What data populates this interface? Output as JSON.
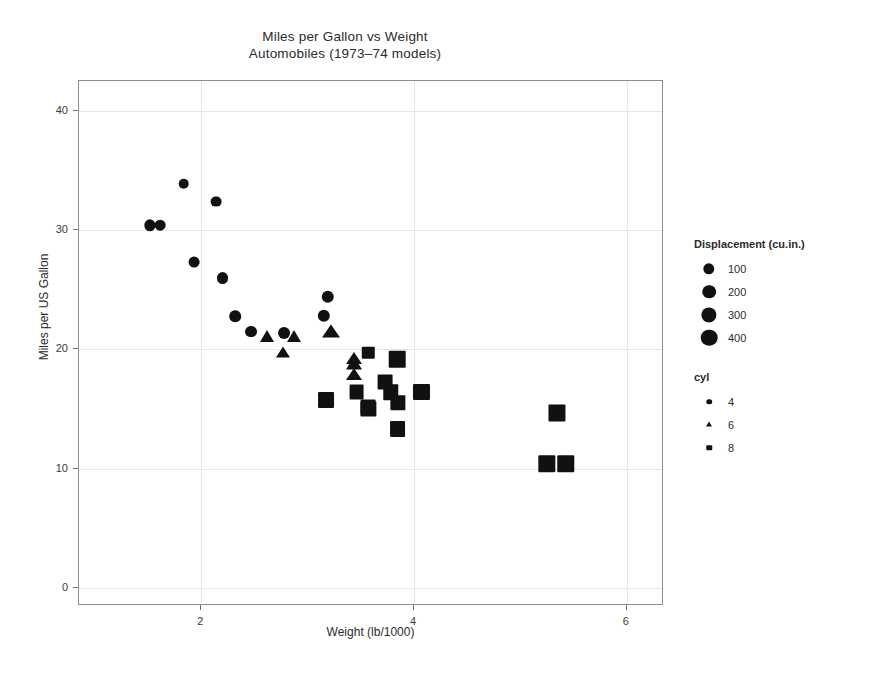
{
  "chart_data": {
    "type": "scatter",
    "title": "Miles per Gallon vs Weight",
    "subtitle": "Automobiles (1973–74 models)",
    "xlabel": "Weight (lb/1000)",
    "ylabel": "Miles per US Gallon",
    "xlim": [
      0.85,
      6.35
    ],
    "ylim": [
      -1.5,
      42.5
    ],
    "xticks": [
      2,
      4,
      6
    ],
    "yticks": [
      0,
      10,
      20,
      30,
      40
    ],
    "grid": true,
    "grid_color": "#e6e6e6",
    "point_color": "#111111",
    "legend_position": "right",
    "size_encoding": {
      "field": "disp",
      "title": "Displacement (cu.in.)",
      "breaks": [
        100,
        200,
        300,
        400
      ],
      "labels": [
        "100",
        "200",
        "300",
        "400"
      ]
    },
    "shape_encoding": {
      "field": "cyl",
      "title": "cyl",
      "breaks": [
        4,
        6,
        8
      ],
      "labels": [
        "4",
        "6",
        "8"
      ],
      "shapes": [
        "circle",
        "triangle",
        "square"
      ]
    },
    "points": [
      {
        "x": 1.513,
        "y": 30.4,
        "disp": 95.1,
        "cyl": 4
      },
      {
        "x": 1.615,
        "y": 30.4,
        "disp": 75.7,
        "cyl": 4
      },
      {
        "x": 1.835,
        "y": 33.9,
        "disp": 71.1,
        "cyl": 4
      },
      {
        "x": 1.935,
        "y": 27.3,
        "disp": 79.0,
        "cyl": 4
      },
      {
        "x": 2.14,
        "y": 32.4,
        "disp": 78.7,
        "cyl": 4
      },
      {
        "x": 2.2,
        "y": 26.0,
        "disp": 120.3,
        "cyl": 4
      },
      {
        "x": 2.32,
        "y": 22.8,
        "disp": 108.0,
        "cyl": 4
      },
      {
        "x": 2.465,
        "y": 21.5,
        "disp": 120.1,
        "cyl": 4
      },
      {
        "x": 2.62,
        "y": 21.0,
        "disp": 160.0,
        "cyl": 6
      },
      {
        "x": 2.77,
        "y": 19.7,
        "disp": 145.0,
        "cyl": 6
      },
      {
        "x": 2.78,
        "y": 21.4,
        "disp": 121.0,
        "cyl": 4
      },
      {
        "x": 2.875,
        "y": 21.0,
        "disp": 160.0,
        "cyl": 6
      },
      {
        "x": 3.15,
        "y": 22.8,
        "disp": 140.8,
        "cyl": 4
      },
      {
        "x": 3.19,
        "y": 24.4,
        "disp": 146.7,
        "cyl": 4
      },
      {
        "x": 3.215,
        "y": 21.4,
        "disp": 258.0,
        "cyl": 6
      },
      {
        "x": 3.44,
        "y": 18.7,
        "disp": 225.0,
        "cyl": 6
      },
      {
        "x": 3.44,
        "y": 19.2,
        "disp": 167.6,
        "cyl": 6
      },
      {
        "x": 3.44,
        "y": 17.8,
        "disp": 167.6,
        "cyl": 6
      },
      {
        "x": 3.46,
        "y": 16.4,
        "disp": 275.8,
        "cyl": 8
      },
      {
        "x": 3.57,
        "y": 15.2,
        "disp": 275.8,
        "cyl": 8
      },
      {
        "x": 3.57,
        "y": 15.0,
        "disp": 301.0,
        "cyl": 8
      },
      {
        "x": 3.73,
        "y": 17.3,
        "disp": 275.8,
        "cyl": 8
      },
      {
        "x": 3.78,
        "y": 16.4,
        "disp": 318.0,
        "cyl": 8
      },
      {
        "x": 3.845,
        "y": 15.5,
        "disp": 304.0,
        "cyl": 8
      },
      {
        "x": 3.845,
        "y": 13.3,
        "disp": 350.0,
        "cyl": 8
      },
      {
        "x": 3.17,
        "y": 15.8,
        "disp": 351.0,
        "cyl": 8
      },
      {
        "x": 3.57,
        "y": 19.7,
        "disp": 145.0,
        "cyl": 8
      },
      {
        "x": 3.84,
        "y": 19.2,
        "disp": 400.0,
        "cyl": 8
      },
      {
        "x": 4.07,
        "y": 16.4,
        "disp": 360.0,
        "cyl": 8
      },
      {
        "x": 5.25,
        "y": 10.4,
        "disp": 460.0,
        "cyl": 8
      },
      {
        "x": 5.424,
        "y": 10.4,
        "disp": 472.0,
        "cyl": 8
      },
      {
        "x": 5.345,
        "y": 14.7,
        "disp": 440.0,
        "cyl": 8
      }
    ]
  },
  "legend": {
    "size_title": "Displacement (cu.in.)",
    "size_items": [
      {
        "label": "100"
      },
      {
        "label": "200"
      },
      {
        "label": "300"
      },
      {
        "label": "400"
      }
    ],
    "shape_title": "cyl",
    "shape_items": [
      {
        "label": "4",
        "shape": "circle"
      },
      {
        "label": "6",
        "shape": "triangle"
      },
      {
        "label": "8",
        "shape": "square"
      }
    ]
  }
}
